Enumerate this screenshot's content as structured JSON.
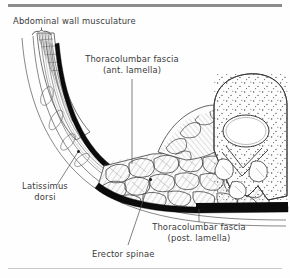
{
  "figure": {
    "type": "anatomical-cross-section",
    "background_color": "#fefefe",
    "ink_color": "#2a2a2a",
    "label_color": "#3a3a3a",
    "rule_color_top": "#8c8c8c",
    "rule_color_bottom": "#c9c9c9"
  },
  "labels": {
    "abdominal_wall": "Abdominal wall musculature",
    "tlf_anterior_line1": "Thoracolumbar fascia",
    "tlf_anterior_line2": "(ant. lamella)",
    "latissimus_line1": "Latissimus",
    "latissimus_line2": "dorsi",
    "tlf_posterior_line1": "Thoracolumbar fascia",
    "tlf_posterior_line2": "(post. lamella)",
    "erector_spinae": "Erector spinae"
  },
  "structures": [
    {
      "name": "abdominal-wall-musculature",
      "kind": "striated-muscle",
      "marker": "bracket"
    },
    {
      "name": "thoracolumbar-fascia-anterior-lamella",
      "kind": "fascia",
      "fill": "#000000"
    },
    {
      "name": "thoracolumbar-fascia-posterior-lamella",
      "kind": "fascia",
      "fill": "#000000"
    },
    {
      "name": "latissimus-dorsi",
      "kind": "aponeurosis"
    },
    {
      "name": "erector-spinae",
      "kind": "muscle-fascicles"
    },
    {
      "name": "lumbar-vertebra",
      "kind": "bone",
      "texture": "stipple"
    },
    {
      "name": "vertebral-foramen",
      "kind": "foramen"
    }
  ]
}
